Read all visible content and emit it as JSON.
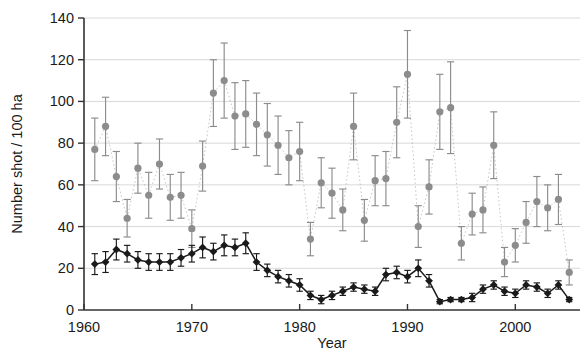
{
  "chart_data": {
    "type": "scatter",
    "title": "",
    "xlabel": "Year",
    "ylabel": "Number shot / 100 ha",
    "xlim": [
      1960,
      2006
    ],
    "ylim": [
      0,
      140
    ],
    "xticks": [
      1960,
      1970,
      1980,
      1990,
      2000
    ],
    "yticks": [
      0,
      20,
      40,
      60,
      80,
      100,
      120,
      140
    ],
    "grid": true,
    "legend": "none",
    "error_bars": "vertical, symmetric, capped",
    "connector": "dotted line between consecutive points",
    "colors": {
      "series_grey": "#8c8c8c",
      "series_black": "#1a1a1a",
      "gridline": "#d9d9d9",
      "axis": "#333333"
    },
    "x": [
      1961,
      1962,
      1963,
      1964,
      1965,
      1966,
      1967,
      1968,
      1969,
      1970,
      1971,
      1972,
      1973,
      1974,
      1975,
      1976,
      1977,
      1978,
      1979,
      1980,
      1981,
      1982,
      1983,
      1984,
      1985,
      1986,
      1987,
      1988,
      1989,
      1990,
      1991,
      1992,
      1993,
      1994,
      1995,
      1996,
      1997,
      1998,
      1999,
      2000,
      2001,
      2002,
      2003,
      2004,
      2005
    ],
    "series": [
      {
        "name": "grey series",
        "marker": "circle",
        "color": "#8c8c8c",
        "values": [
          77,
          88,
          64,
          44,
          68,
          55,
          70,
          54,
          55,
          39,
          69,
          104,
          110,
          93,
          94,
          89,
          84,
          79,
          73,
          76,
          34,
          61,
          56,
          48,
          88,
          43,
          62,
          63,
          90,
          113,
          40,
          59,
          95,
          97,
          32,
          46,
          48,
          79,
          23,
          31,
          42,
          52,
          49,
          53,
          18
        ],
        "err_low": [
          15,
          14,
          12,
          9,
          12,
          11,
          12,
          11,
          11,
          9,
          12,
          16,
          18,
          16,
          16,
          15,
          15,
          14,
          13,
          14,
          8,
          12,
          12,
          10,
          16,
          10,
          12,
          13,
          17,
          21,
          10,
          13,
          18,
          22,
          8,
          10,
          11,
          16,
          7,
          8,
          10,
          12,
          11,
          12,
          6
        ],
        "err_high": [
          15,
          14,
          12,
          9,
          12,
          11,
          12,
          11,
          11,
          9,
          12,
          16,
          18,
          16,
          16,
          15,
          15,
          14,
          13,
          14,
          8,
          12,
          12,
          10,
          16,
          10,
          12,
          13,
          17,
          21,
          10,
          13,
          18,
          22,
          8,
          10,
          11,
          16,
          7,
          8,
          10,
          12,
          11,
          12,
          6
        ]
      },
      {
        "name": "black series",
        "marker": "diamond",
        "color": "#1a1a1a",
        "values": [
          22,
          23,
          29,
          27,
          24,
          23,
          23,
          23,
          25,
          27,
          30,
          28,
          31,
          30,
          32,
          23,
          19,
          16,
          14,
          12,
          7,
          5,
          7,
          9,
          11,
          10,
          9,
          17,
          18,
          16,
          20,
          14,
          4,
          5,
          5,
          6,
          10,
          12,
          9,
          8,
          12,
          11,
          8,
          12,
          5
        ],
        "err_low": [
          5,
          5,
          5,
          4,
          4,
          4,
          4,
          4,
          4,
          4,
          5,
          4,
          5,
          4,
          5,
          4,
          3,
          3,
          3,
          3,
          2,
          2,
          2,
          2,
          2,
          2,
          2,
          3,
          3,
          3,
          4,
          3,
          1,
          1,
          1,
          2,
          2,
          2,
          2,
          2,
          2,
          2,
          2,
          2,
          1
        ],
        "err_high": [
          5,
          5,
          5,
          4,
          4,
          4,
          4,
          4,
          4,
          4,
          5,
          4,
          5,
          4,
          5,
          4,
          3,
          3,
          3,
          3,
          2,
          2,
          2,
          2,
          2,
          2,
          2,
          3,
          3,
          3,
          4,
          3,
          1,
          1,
          1,
          2,
          2,
          2,
          2,
          2,
          2,
          2,
          2,
          2,
          1
        ]
      }
    ]
  }
}
